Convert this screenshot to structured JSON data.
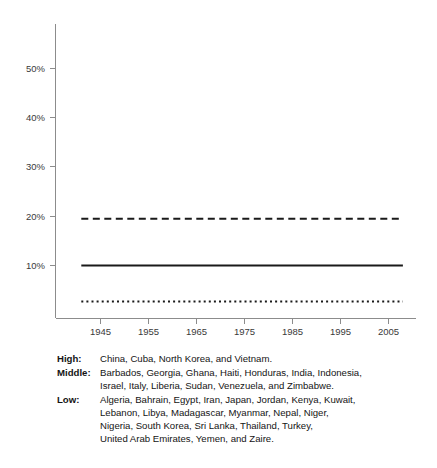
{
  "chart_data": {
    "type": "line",
    "title": "",
    "xlabel": "",
    "ylabel": "",
    "xlim": [
      1941,
      2008
    ],
    "ylim": [
      0,
      56
    ],
    "grid": false,
    "legend_position": "below-plot-as-caption",
    "x_ticks": [
      1945,
      1955,
      1965,
      1975,
      1985,
      1995,
      2005
    ],
    "x_tick_labels": [
      "1945",
      "1955",
      "1965",
      "1975",
      "1985",
      "1995",
      "2005"
    ],
    "y_ticks": [
      10,
      20,
      30,
      40,
      50
    ],
    "y_tick_labels": [
      "10%",
      "20%",
      "30%",
      "40%",
      "50%"
    ],
    "x": [
      1941,
      2008
    ],
    "series": [
      {
        "name": "Middle",
        "style": "dashed",
        "color": "#1a1a1a",
        "values": [
          19.5,
          19.5
        ]
      },
      {
        "name": "High",
        "style": "solid",
        "color": "#1a1a1a",
        "values": [
          10.0,
          10.0
        ]
      },
      {
        "name": "Low",
        "style": "dotted",
        "color": "#1a1a1a",
        "values": [
          2.7,
          2.7
        ]
      }
    ]
  },
  "caption": {
    "rows": [
      {
        "key": "High:",
        "lines": [
          "China, Cuba, North Korea, and Vietnam."
        ]
      },
      {
        "key": "Middle:",
        "lines": [
          "Barbados, Georgia, Ghana, Haiti, Honduras, India, Indonesia,",
          "Israel, Italy, Liberia, Sudan, Venezuela, and Zimbabwe."
        ]
      },
      {
        "key": "Low:",
        "lines": [
          "Algeria, Bahrain, Egypt, Iran, Japan, Jordan, Kenya, Kuwait,",
          "Lebanon, Libya, Madagascar, Myanmar, Nepal, Niger,",
          "Nigeria, South Korea, Sri Lanka, Thailand, Turkey,",
          "United Arab Emirates, Yemen, and Zaire."
        ]
      }
    ]
  }
}
